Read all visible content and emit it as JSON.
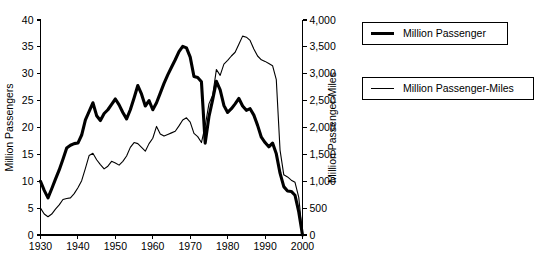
{
  "chart_data": {
    "type": "line",
    "title": "",
    "xlabel": "",
    "ylabel": "Million Passengers",
    "y2label": "Million Passenger-Miles",
    "grid": false,
    "legend_position": "right",
    "xlim": [
      1930,
      2000
    ],
    "ylim": [
      0,
      40
    ],
    "y2lim": [
      0,
      4000
    ],
    "xticks": [
      1930,
      1940,
      1950,
      1960,
      1970,
      1980,
      1990,
      2000
    ],
    "xtick_labels": [
      "1930",
      "1940",
      "1950",
      "1960",
      "1970",
      "1980",
      "1990",
      "2000"
    ],
    "yticks": [
      0,
      5,
      10,
      15,
      20,
      25,
      30,
      35,
      40
    ],
    "ytick_labels": [
      "0",
      "5",
      "10",
      "15",
      "20",
      "25",
      "30",
      "35",
      "40"
    ],
    "y2ticks": [
      0,
      500,
      1000,
      1500,
      2000,
      2500,
      3000,
      3500,
      4000
    ],
    "y2tick_labels": [
      "0",
      "500",
      "1,000",
      "1,500",
      "2,000",
      "2,500",
      "3,000",
      "3,500",
      "4,000"
    ],
    "x": [
      1930,
      1931,
      1932,
      1933,
      1934,
      1935,
      1936,
      1937,
      1938,
      1939,
      1940,
      1941,
      1942,
      1943,
      1944,
      1945,
      1946,
      1947,
      1948,
      1949,
      1950,
      1951,
      1952,
      1953,
      1954,
      1955,
      1956,
      1957,
      1958,
      1959,
      1960,
      1961,
      1962,
      1963,
      1964,
      1965,
      1966,
      1967,
      1968,
      1969,
      1970,
      1971,
      1972,
      1973,
      1974,
      1975,
      1976,
      1977,
      1978,
      1979,
      1980,
      1981,
      1982,
      1983,
      1984,
      1985,
      1986,
      1987,
      1988,
      1989,
      1990,
      1991,
      1992,
      1993,
      1994,
      1995,
      1996,
      1997,
      1998,
      1999,
      2000
    ],
    "series": [
      {
        "name": "Million Passenger",
        "axis": "left",
        "style": "thick",
        "color": "#000000",
        "values": [
          10.0,
          8.3,
          6.9,
          8.6,
          10.4,
          12.1,
          14.1,
          16.2,
          16.7,
          17.0,
          17.1,
          18.6,
          21.4,
          23.0,
          24.6,
          22.2,
          21.3,
          22.6,
          23.3,
          24.3,
          25.3,
          24.2,
          22.8,
          21.6,
          23.3,
          25.5,
          27.8,
          26.2,
          24.0,
          25.0,
          23.3,
          24.6,
          26.4,
          28.2,
          29.8,
          31.2,
          32.6,
          34.1,
          35.1,
          34.8,
          33.1,
          29.5,
          29.3,
          28.5,
          17.1,
          22.0,
          25.2,
          28.6,
          27.0,
          24.1,
          22.8,
          23.5,
          24.4,
          25.4,
          24.0,
          23.2,
          23.5,
          22.3,
          20.4,
          18.2,
          17.2,
          16.4,
          17.1,
          15.1,
          11.5,
          9.0,
          8.2,
          8.1,
          7.4,
          4.3,
          0.0
        ]
      },
      {
        "name": "Million Passenger-Miles",
        "axis": "right",
        "style": "thin",
        "color": "#000000",
        "values": [
          500,
          390,
          340,
          390,
          480,
          560,
          660,
          680,
          690,
          770,
          880,
          1010,
          1240,
          1480,
          1520,
          1400,
          1310,
          1230,
          1280,
          1370,
          1340,
          1300,
          1370,
          1470,
          1630,
          1720,
          1700,
          1630,
          1560,
          1700,
          1800,
          2020,
          1880,
          1840,
          1870,
          1900,
          1930,
          2030,
          2140,
          2180,
          2100,
          1890,
          1830,
          1720,
          2030,
          2440,
          2600,
          3080,
          2970,
          3180,
          3250,
          3330,
          3400,
          3550,
          3700,
          3680,
          3620,
          3460,
          3330,
          3260,
          3230,
          3190,
          3150,
          2890,
          1580,
          1120,
          1080,
          1020,
          980,
          700,
          0
        ]
      }
    ]
  },
  "legend": {
    "items": [
      {
        "label": "Million Passenger",
        "style": "thick"
      },
      {
        "label": "Million Passenger-Miles",
        "style": "thin"
      }
    ]
  }
}
